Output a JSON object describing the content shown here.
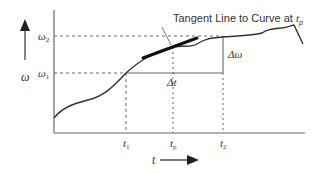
{
  "diagram": {
    "title_annotation": "Tangent Line to Curve at ",
    "title_annotation_sub": "p",
    "title_annotation_var": "t",
    "y_axis_label": "ω",
    "x_axis_label": "t",
    "y_ticks": [
      {
        "label": "ω",
        "sub": "2",
        "name": "omega-2"
      },
      {
        "label": "ω",
        "sub": "1",
        "name": "omega-1"
      }
    ],
    "x_ticks": [
      {
        "label": "t",
        "sub": "1",
        "name": "t-1"
      },
      {
        "label": "t",
        "sub": "p",
        "name": "t-p"
      },
      {
        "label": "t",
        "sub": "2",
        "name": "t-2"
      }
    ],
    "delta_t_label": "Δt",
    "delta_omega_label": "Δω",
    "colors": {
      "curve": "#333333",
      "axis": "#777777",
      "dashed": "#555555",
      "tangent": "#111111"
    }
  }
}
